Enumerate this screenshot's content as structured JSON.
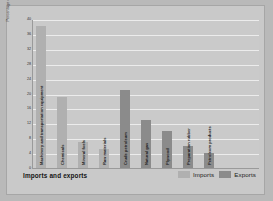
{
  "chart_data": {
    "type": "bar",
    "title": "Imports and exports",
    "xlabel": "",
    "ylabel": "Percentage of total",
    "ylim": [
      0,
      40
    ],
    "yticks": [
      0,
      4,
      8,
      12,
      16,
      20,
      24,
      28,
      32,
      36,
      40
    ],
    "grid": true,
    "legend_position": "bottom-right",
    "categories": [
      "Machinery and transportation equipment",
      "Chemicals",
      "Mineral fuels",
      "Raw materials",
      "Crude petroleum",
      "Natural gas",
      "Plywood",
      "Preparation rubber",
      "Petroleum products"
    ],
    "values": [
      38,
      19,
      7,
      5,
      21,
      13,
      10,
      6,
      4
    ],
    "series": [
      {
        "name": "Imports",
        "color": "#b0b0b0",
        "points": [
          {
            "label": "Machinery and transportation equipment",
            "value": 38
          },
          {
            "label": "Chemicals",
            "value": 19
          },
          {
            "label": "Mineral fuels",
            "value": 7
          },
          {
            "label": "Raw materials",
            "value": 5
          }
        ]
      },
      {
        "name": "Exports",
        "color": "#8b8b8b",
        "points": [
          {
            "label": "Crude petroleum",
            "value": 21
          },
          {
            "label": "Natural gas",
            "value": 13
          },
          {
            "label": "Plywood",
            "value": 10
          },
          {
            "label": "Preparation rubber",
            "value": 6
          },
          {
            "label": "Petroleum products",
            "value": 4
          }
        ]
      }
    ],
    "bars": [
      {
        "label": "Machinery and transportation equipment",
        "value": 38,
        "series": "Imports"
      },
      {
        "label": "Chemicals",
        "value": 19,
        "series": "Imports"
      },
      {
        "label": "Mineral fuels",
        "value": 7,
        "series": "Imports"
      },
      {
        "label": "Raw materials",
        "value": 5,
        "series": "Imports"
      },
      {
        "label": "Crude petroleum",
        "value": 21,
        "series": "Exports"
      },
      {
        "label": "Natural gas",
        "value": 13,
        "series": "Exports"
      },
      {
        "label": "Plywood",
        "value": 10,
        "series": "Exports"
      },
      {
        "label": "Preparation rubber",
        "value": 6,
        "series": "Exports"
      },
      {
        "label": "Petroleum products",
        "value": 4,
        "series": "Exports"
      }
    ]
  },
  "legend": {
    "imports_label": "Imports",
    "exports_label": "Exports"
  },
  "colors": {
    "imports": "#b0b0b0",
    "exports": "#8b8b8b",
    "background": "#c9c9c9",
    "plot_background": "#cacaca",
    "gridline": "#ececec",
    "axis": "#9a9a9a"
  }
}
